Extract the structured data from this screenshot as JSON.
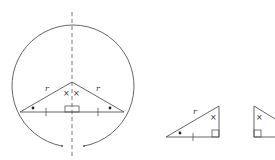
{
  "diagram": {
    "labels": {
      "side_left": "r",
      "side_right": "r",
      "small_triangle_side": "r"
    },
    "markers": {
      "apex_angle": "×",
      "base_angle": "•",
      "tick": "|"
    },
    "colors": {
      "stroke": "#555555",
      "background": "#ffffff"
    }
  }
}
